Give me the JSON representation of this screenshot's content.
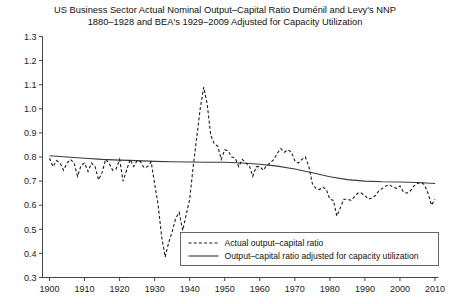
{
  "chart_data": {
    "type": "line",
    "title_line1": "US Business Sector Actual Nominal Output–Capital Ratio Duménil and Levy's NNP",
    "title_line2": "1880–1928 and BEA's 1929–2009 Adjusted for Capacity Utilization",
    "xlabel": "",
    "ylabel": "",
    "xlim": [
      1898,
      2011
    ],
    "ylim": [
      0.3,
      1.3
    ],
    "grid": false,
    "legend_position": "bottom-right",
    "x_ticks": [
      1900,
      1910,
      1920,
      1930,
      1940,
      1950,
      1960,
      1970,
      1980,
      1990,
      2000,
      2010
    ],
    "x_tick_labels": [
      "1900",
      "1910",
      "1920",
      "1930",
      "1940",
      "1950",
      "1960",
      "1970",
      "1980",
      "1990",
      "2000",
      "2010"
    ],
    "y_ticks": [
      0.3,
      0.4,
      0.5,
      0.6,
      0.7,
      0.8,
      0.9,
      1.0,
      1.1,
      1.2,
      1.3
    ],
    "y_tick_labels": [
      "0.3",
      "0.4",
      "0.5",
      "0.6",
      "0.7",
      "0.8",
      "0.9",
      "1.0",
      "1.1",
      "1.2",
      "1.3"
    ],
    "series": [
      {
        "name": "Actual output–capital ratio",
        "style": "dashed",
        "color": "#1a1a1a",
        "x": [
          1900,
          1901,
          1902,
          1903,
          1904,
          1905,
          1906,
          1907,
          1908,
          1909,
          1910,
          1911,
          1912,
          1913,
          1914,
          1915,
          1916,
          1917,
          1918,
          1919,
          1920,
          1921,
          1922,
          1923,
          1924,
          1925,
          1926,
          1927,
          1928,
          1929,
          1930,
          1931,
          1932,
          1933,
          1934,
          1935,
          1936,
          1937,
          1938,
          1939,
          1940,
          1941,
          1942,
          1943,
          1944,
          1945,
          1946,
          1947,
          1948,
          1949,
          1950,
          1951,
          1952,
          1953,
          1954,
          1955,
          1956,
          1957,
          1958,
          1959,
          1960,
          1961,
          1962,
          1963,
          1964,
          1965,
          1966,
          1967,
          1968,
          1969,
          1970,
          1971,
          1972,
          1973,
          1974,
          1975,
          1976,
          1977,
          1978,
          1979,
          1980,
          1981,
          1982,
          1983,
          1984,
          1985,
          1986,
          1987,
          1988,
          1989,
          1990,
          1991,
          1992,
          1993,
          1994,
          1995,
          1996,
          1997,
          1998,
          1999,
          2000,
          2001,
          2002,
          2003,
          2004,
          2005,
          2006,
          2007,
          2008,
          2009,
          2010
        ],
        "y": [
          0.795,
          0.76,
          0.785,
          0.775,
          0.745,
          0.775,
          0.79,
          0.775,
          0.72,
          0.765,
          0.775,
          0.74,
          0.775,
          0.76,
          0.705,
          0.735,
          0.79,
          0.775,
          0.745,
          0.75,
          0.79,
          0.7,
          0.745,
          0.79,
          0.76,
          0.785,
          0.78,
          0.755,
          0.76,
          0.78,
          0.69,
          0.6,
          0.47,
          0.385,
          0.445,
          0.49,
          0.545,
          0.57,
          0.495,
          0.56,
          0.625,
          0.76,
          0.88,
          1.0,
          1.09,
          1.02,
          0.89,
          0.855,
          0.845,
          0.79,
          0.83,
          0.825,
          0.8,
          0.795,
          0.76,
          0.79,
          0.775,
          0.765,
          0.72,
          0.76,
          0.76,
          0.745,
          0.765,
          0.775,
          0.79,
          0.815,
          0.835,
          0.82,
          0.83,
          0.82,
          0.785,
          0.775,
          0.79,
          0.8,
          0.76,
          0.69,
          0.67,
          0.665,
          0.675,
          0.665,
          0.625,
          0.62,
          0.555,
          0.59,
          0.625,
          0.625,
          0.62,
          0.635,
          0.65,
          0.65,
          0.64,
          0.625,
          0.63,
          0.64,
          0.66,
          0.67,
          0.68,
          0.685,
          0.675,
          0.67,
          0.68,
          0.655,
          0.65,
          0.66,
          0.68,
          0.69,
          0.695,
          0.685,
          0.65,
          0.6,
          0.625
        ]
      },
      {
        "name": "Output–capital ratio adjusted for capacity utilization",
        "style": "solid",
        "color": "#3a3a3a",
        "x": [
          1900,
          1905,
          1910,
          1915,
          1920,
          1925,
          1930,
          1935,
          1940,
          1945,
          1950,
          1955,
          1960,
          1965,
          1970,
          1975,
          1980,
          1985,
          1990,
          1995,
          2000,
          2005,
          2010
        ],
        "y": [
          0.805,
          0.8,
          0.795,
          0.79,
          0.787,
          0.785,
          0.782,
          0.78,
          0.779,
          0.778,
          0.778,
          0.775,
          0.77,
          0.762,
          0.75,
          0.735,
          0.718,
          0.706,
          0.7,
          0.697,
          0.696,
          0.694,
          0.69
        ]
      }
    ],
    "annotations": {
      "depression_trough": {
        "year": 1933,
        "value": 0.385
      },
      "wwii_peak": {
        "year": 1944,
        "value": 1.09
      },
      "recession_trough_1982": {
        "year": 1982,
        "value": 0.555
      }
    }
  },
  "legend": {
    "entries": [
      {
        "label": "Actual output–capital ratio",
        "style": "dashed"
      },
      {
        "label": "Output–capital ratio adjusted for capacity utilization",
        "style": "solid"
      }
    ]
  },
  "colors": {
    "background": "#ffffff",
    "axis": "#444444",
    "text": "#111111",
    "series_dashed": "#1a1a1a",
    "series_solid": "#3a3a3a",
    "legend_border": "#555555"
  }
}
